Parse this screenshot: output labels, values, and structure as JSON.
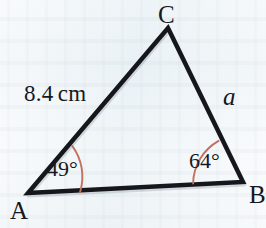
{
  "figure": {
    "name": "triangle-abc-diagram",
    "type": "geometry-diagram",
    "background_color": "#eef4f7",
    "stroke_color": "#15171c",
    "arc_color": "#c2705f",
    "text_color": "#16181d"
  },
  "vertices": [
    {
      "id": "C",
      "label": "C",
      "x": 168,
      "y": 28
    },
    {
      "id": "A",
      "label": "A",
      "x": 28,
      "y": 193
    },
    {
      "id": "B",
      "label": "B",
      "x": 243,
      "y": 182
    }
  ],
  "sides": [
    {
      "id": "AC",
      "label": "8.4",
      "unit": "cm",
      "from": "A",
      "to": "C"
    },
    {
      "id": "BC",
      "label": "a",
      "unit": "",
      "from": "B",
      "to": "C"
    },
    {
      "id": "AB",
      "label": "",
      "unit": "",
      "from": "A",
      "to": "B"
    }
  ],
  "angles": [
    {
      "id": "A",
      "label": "49°",
      "value": 49,
      "vertex": "A",
      "arc_radius": 52
    },
    {
      "id": "B",
      "label": "64°",
      "value": 64,
      "vertex": "B",
      "arc_radius": 50
    }
  ],
  "geometry": {
    "triangle_path": "M 28 193 L 168 28 L 243 182 Z",
    "arc_a_path": "M 72.2 145.9 A 52 52 0 0 1 80.0 192.4",
    "arc_b_path": "M 193.1 183.6 A 50 50 0 0 1 218.6 140.9"
  }
}
